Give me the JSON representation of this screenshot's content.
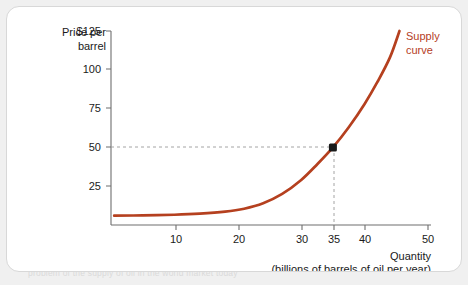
{
  "figure": {
    "panel_background": "#ffffff",
    "panel_border": "#d8d8d8",
    "page_background": "#f0f0f0"
  },
  "ghost_text": [
    {
      "text": "Compared to the bargaining  power and the free-rider",
      "x": 28,
      "y": 263
    },
    {
      "text": "problem of the supply of oil in the world market today",
      "x": 28,
      "y": 274
    }
  ],
  "chart_data": {
    "type": "line",
    "title": "",
    "subtitle": "",
    "xlabel": "Quantity",
    "xlabel_sub": "(billions of barrels of oil per year)",
    "ylabel": "Price per",
    "ylabel_sub": "barrel",
    "xlim": [
      0,
      50
    ],
    "ylim": [
      0,
      125
    ],
    "grid": false,
    "legend_position": "inline-right",
    "x_ticks": [
      10,
      20,
      30,
      35,
      40,
      50
    ],
    "x_tick_labels": [
      "10",
      "20",
      "30",
      "35",
      "40",
      "50"
    ],
    "y_ticks": [
      25,
      50,
      75,
      100,
      125
    ],
    "y_tick_labels": [
      "25",
      "50",
      "75",
      "100",
      "$125"
    ],
    "series": [
      {
        "name": "Supply curve",
        "color": "#b5401f",
        "points": [
          {
            "x": 0.5,
            "y": 6
          },
          {
            "x": 5,
            "y": 6.2
          },
          {
            "x": 10,
            "y": 6.6
          },
          {
            "x": 14,
            "y": 7.3
          },
          {
            "x": 18,
            "y": 8.6
          },
          {
            "x": 21,
            "y": 10.5
          },
          {
            "x": 24,
            "y": 14
          },
          {
            "x": 27,
            "y": 20
          },
          {
            "x": 30,
            "y": 29
          },
          {
            "x": 32.5,
            "y": 39
          },
          {
            "x": 35,
            "y": 50
          },
          {
            "x": 37.5,
            "y": 63
          },
          {
            "x": 40,
            "y": 78
          },
          {
            "x": 42,
            "y": 92
          },
          {
            "x": 44,
            "y": 108
          },
          {
            "x": 45.5,
            "y": 125
          }
        ]
      }
    ],
    "annotations": [
      {
        "name": "equilibrium-point",
        "x": 35,
        "y": 50,
        "marker": "square",
        "color": "#1a1a1a",
        "guide_x": true,
        "guide_y": true
      }
    ],
    "curve_label": {
      "line1": "Supply",
      "line2": "curve",
      "color": "#b5401f"
    }
  }
}
